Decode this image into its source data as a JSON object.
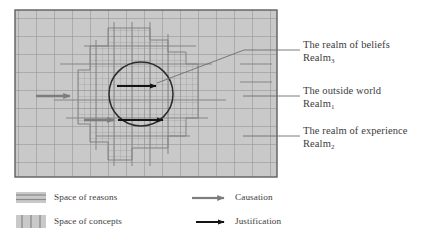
{
  "figure": {
    "type": "conceptual-diagram"
  },
  "callouts": [
    {
      "id": "realm-of-beliefs",
      "line1": "The realm of beliefs",
      "line2_base": "Realm",
      "line2_sub": "3"
    },
    {
      "id": "outside-world",
      "line1": "The outside world",
      "line2_base": "Realm",
      "line2_sub": "1"
    },
    {
      "id": "realm-of-experience",
      "line1": "The realm of experience",
      "line2_base": "Realm",
      "line2_sub": "2"
    }
  ],
  "legend": {
    "swatches": [
      {
        "id": "space-of-reasons",
        "label": "Space of reasons",
        "pattern": "horizontal-lines"
      },
      {
        "id": "space-of-concepts",
        "label": "Space of concepts",
        "pattern": "vertical-lines"
      }
    ],
    "arrows": [
      {
        "id": "causation",
        "label": "Causation",
        "color": "#7a7a7a"
      },
      {
        "id": "justification",
        "label": "Justification",
        "color": "#1a1a1a"
      }
    ]
  },
  "colors": {
    "field_fill": "#c9c9c9",
    "coarse_grid": "#8f8f8f",
    "fine_grid": "#9a9a9a",
    "outline": "#5a5a5a",
    "circle": "#2b2b2b",
    "causation_arrow": "#7a7a7a",
    "justification_arrow": "#141414",
    "leader_line": "#6d6d6d",
    "text": "#3c3c3c"
  },
  "geometry": {
    "field_box": {
      "x": 15,
      "y": 10,
      "w": 262,
      "h": 167
    },
    "circle": {
      "cx": 141,
      "cy": 94,
      "r": 32
    },
    "coarse_cell": 18,
    "fine_cell": 6
  }
}
